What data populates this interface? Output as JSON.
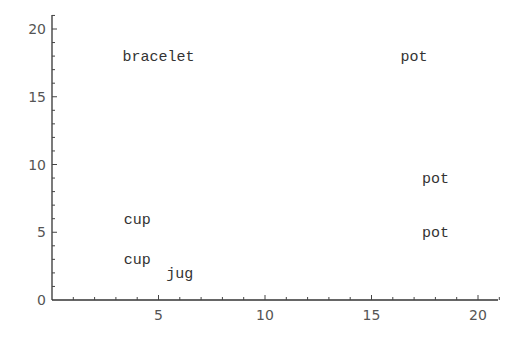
{
  "chart_data": {
    "type": "scatter",
    "title": "",
    "xlabel": "",
    "ylabel": "",
    "xlim": [
      0,
      21
    ],
    "ylim": [
      0,
      21
    ],
    "grid": false,
    "legend": null,
    "x_ticks": [
      5,
      10,
      15,
      20
    ],
    "y_ticks": [
      0,
      5,
      10,
      15,
      20
    ],
    "x_tick_labels": [
      "5",
      "10",
      "15",
      "20"
    ],
    "y_tick_labels": [
      "0",
      "5",
      "10",
      "15",
      "20"
    ],
    "points": [
      {
        "label": "bracelet",
        "x": 5,
        "y": 18
      },
      {
        "label": "pot",
        "x": 17,
        "y": 18
      },
      {
        "label": "pot",
        "x": 18,
        "y": 9
      },
      {
        "label": "pot",
        "x": 18,
        "y": 5
      },
      {
        "label": "cup",
        "x": 4,
        "y": 6
      },
      {
        "label": "cup",
        "x": 4,
        "y": 3
      },
      {
        "label": "jug",
        "x": 6,
        "y": 2
      }
    ],
    "marker": "text-label"
  },
  "layout": {
    "origin_px": [
      52,
      300
    ],
    "px_per_x": 21.3,
    "px_per_y": 13.55,
    "x_axis_end_px": 498,
    "y_axis_top_px": 15,
    "minor_ticks_per_major": 4
  }
}
